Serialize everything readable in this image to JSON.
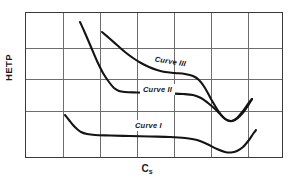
{
  "figure": {
    "kind": "line-chart-diagram",
    "background_color": "#ffffff"
  },
  "axes": {
    "y_title": "HETP",
    "x_title_base": "C",
    "x_title_sub": "s",
    "frame_color": "#3a3a3a",
    "grid_color": "#6d6d6d",
    "grid_vertical_count": 6,
    "grid_horizontal_count": 3
  },
  "labels": {
    "curve1": "Curve I",
    "curve2": "Curve II",
    "curve3": "Curve III"
  },
  "chart_data": {
    "type": "line",
    "title": "",
    "subtitle": "",
    "xlabel": "Cs",
    "ylabel": "HETP",
    "xlim": [
      0,
      258
    ],
    "ylim": [
      0,
      146
    ],
    "y_axis_direction": "inverted-pixel-space",
    "grid": true,
    "grid_x_positions": [
      37,
      74,
      111,
      148,
      185,
      222
    ],
    "grid_y_positions": [
      35,
      66,
      98
    ],
    "legend": "inline-labels",
    "legend_position": "on-curve",
    "axis_tick_labels": {
      "x": [],
      "y": []
    },
    "annotations": [
      {
        "text": "Curve III",
        "x": 127,
        "y": 41,
        "rotation_deg": 9,
        "italic": true
      },
      {
        "text": "Curve II",
        "x": 115,
        "y": 72,
        "rotation_deg": 0,
        "italic": true
      },
      {
        "text": "Curve I",
        "x": 107,
        "y": 108,
        "rotation_deg": 0,
        "italic": true
      }
    ],
    "series": [
      {
        "name": "Curve I",
        "stroke": "#141414",
        "points": [
          [
            40,
            103
          ],
          [
            44,
            108
          ],
          [
            48,
            113
          ],
          [
            52,
            117
          ],
          [
            56,
            120
          ],
          [
            62,
            122
          ],
          [
            70,
            123
          ],
          [
            85,
            123.5
          ],
          [
            105,
            124
          ],
          [
            125,
            124.5
          ],
          [
            145,
            125
          ],
          [
            160,
            126
          ],
          [
            172,
            128
          ],
          [
            182,
            132
          ],
          [
            192,
            137
          ],
          [
            200,
            140
          ],
          [
            206,
            140.5
          ],
          [
            212,
            139
          ],
          [
            218,
            135
          ],
          [
            224,
            128
          ],
          [
            228,
            122
          ],
          [
            231,
            118
          ]
        ]
      },
      {
        "name": "Curve II",
        "stroke": "#141414",
        "points": [
          [
            55,
            10
          ],
          [
            60,
            21
          ],
          [
            66,
            35
          ],
          [
            72,
            49
          ],
          [
            78,
            61
          ],
          [
            84,
            70
          ],
          [
            89,
            76
          ],
          [
            94,
            79
          ],
          [
            100,
            80
          ],
          [
            112,
            80.5
          ],
          [
            128,
            81
          ],
          [
            145,
            81.5
          ],
          [
            158,
            82
          ],
          [
            168,
            83
          ],
          [
            176,
            86
          ],
          [
            183,
            91
          ],
          [
            190,
            97
          ],
          [
            196,
            103
          ],
          [
            200,
            107
          ],
          [
            205,
            109
          ],
          [
            210,
            108
          ],
          [
            215,
            104
          ],
          [
            220,
            98
          ],
          [
            224,
            92
          ],
          [
            227,
            87
          ]
        ]
      },
      {
        "name": "Curve III",
        "stroke": "#141414",
        "points": [
          [
            77,
            20
          ],
          [
            84,
            26
          ],
          [
            92,
            33
          ],
          [
            100,
            40
          ],
          [
            108,
            46
          ],
          [
            116,
            51
          ],
          [
            124,
            55
          ],
          [
            132,
            58
          ],
          [
            140,
            60
          ],
          [
            150,
            61
          ],
          [
            160,
            62
          ],
          [
            168,
            64
          ],
          [
            174,
            68
          ],
          [
            180,
            76
          ],
          [
            186,
            87
          ],
          [
            192,
            97
          ],
          [
            197,
            104
          ],
          [
            202,
            108
          ],
          [
            207,
            109
          ],
          [
            212,
            106
          ],
          [
            218,
            99
          ],
          [
            223,
            92
          ],
          [
            227,
            87
          ]
        ]
      }
    ]
  }
}
